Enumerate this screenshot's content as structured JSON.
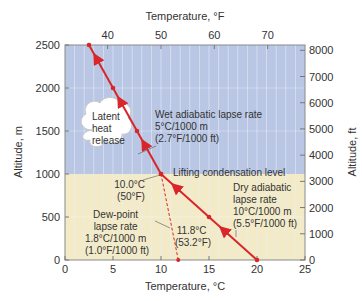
{
  "chart_data": {
    "type": "line",
    "title": "",
    "xlabel": "Temperature, °C",
    "xlabel_top": "Temperature, °F",
    "ylabel": "Altitude, m",
    "ylabel_right": "Altitude, ft",
    "xlim": [
      0,
      25
    ],
    "ylim": [
      0,
      2500
    ],
    "x_ticks": [
      0,
      5,
      10,
      15,
      20,
      25
    ],
    "x_ticks_top": [
      40,
      50,
      60,
      70
    ],
    "y_ticks": [
      0,
      500,
      1000,
      1500,
      2000,
      2500
    ],
    "y_ticks_right": [
      0,
      1000,
      2000,
      3000,
      4000,
      5000,
      6000,
      7000,
      8000
    ],
    "grid": true,
    "colors": {
      "upper_region": "#b9c7e4",
      "lower_region": "#f3ebc8",
      "line": "#d8262a",
      "gridline": "#e8eef8"
    },
    "series": [
      {
        "name": "Dry adiabatic lapse rate",
        "style": "solid",
        "x": [
          20,
          15,
          10
        ],
        "y": [
          0,
          500,
          1000
        ]
      },
      {
        "name": "Wet adiabatic lapse rate",
        "style": "solid",
        "x": [
          10,
          7.5,
          5,
          2.5
        ],
        "y": [
          1000,
          1500,
          2000,
          2500
        ]
      },
      {
        "name": "Dew-point lapse rate",
        "style": "dashed",
        "x": [
          11.8,
          10
        ],
        "y": [
          0,
          1000
        ]
      }
    ],
    "annotations": {
      "wet_rate": [
        "Wet adiabatic lapse rate",
        "5°C/1000 m",
        "(2.7°F/1000 ft)"
      ],
      "dry_rate": [
        "Dry adiabatic",
        "lapse rate",
        "10°C/1000 m",
        "(5.5°F/1000 ft)"
      ],
      "dew_rate": [
        "Dew-point",
        "lapse rate",
        "1.8°C/1000 m",
        "(1.0°F/1000 ft)"
      ],
      "lcl": "Lifting condensation level",
      "lcl_temp": [
        "10.0°C",
        "(50°F)"
      ],
      "surface_dew": [
        "11.8°C",
        "(53.2°F)"
      ],
      "cloud": [
        "Latent",
        "heat",
        "release"
      ]
    }
  }
}
